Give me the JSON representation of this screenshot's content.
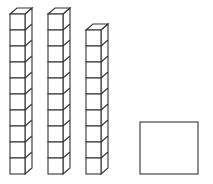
{
  "diagram": {
    "colors": {
      "stroke": "#333333",
      "fill": "#ffffff",
      "background": "#ffffff"
    },
    "rods": [
      {
        "label": "rod-1",
        "cubes": 10,
        "x": 10
      },
      {
        "label": "rod-2",
        "cubes": 10,
        "x": 48
      },
      {
        "label": "rod-3",
        "cubes": 9,
        "x": 86
      }
    ],
    "cube": {
      "width": 15,
      "height": 16,
      "depth_dx": 7,
      "depth_dy": 6
    },
    "baseline_y": 174,
    "square": {
      "x": 140,
      "y": 122,
      "width": 58,
      "height": 52
    }
  }
}
